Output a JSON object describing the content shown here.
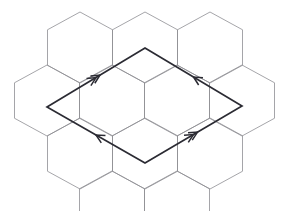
{
  "figure": {
    "canvas": {
      "width": 290,
      "height": 211
    },
    "background_color": "#ffffff"
  },
  "colors": {
    "hex_stroke": "#8e8e93",
    "domain_stroke": "#2b2b33",
    "arrow_stroke": "#2b2b33",
    "background": "#ffffff"
  },
  "style": {
    "hex_stroke_width": 0.8,
    "domain_stroke_width": 1.7,
    "arrow_stroke_width": 1.5
  },
  "hex_lattice": {
    "orientation": "pointy-top",
    "hex_width": 65,
    "hex_height": 71,
    "side_length": 35.5,
    "column_spacing": 65,
    "row_spacing": 53,
    "cell_count": 12,
    "cells": [
      {
        "name": "hex-r0-c0",
        "cx": 80,
        "cy": 12
      },
      {
        "name": "hex-r0-c1",
        "cx": 145,
        "cy": 12
      },
      {
        "name": "hex-r0-c2",
        "cx": 210,
        "cy": 12
      },
      {
        "name": "hex-r1-c0",
        "cx": 47,
        "cy": 65
      },
      {
        "name": "hex-r1-c1",
        "cx": 112,
        "cy": 65
      },
      {
        "name": "hex-r1-c2",
        "cx": 177,
        "cy": 65
      },
      {
        "name": "hex-r1-c3",
        "cx": 242,
        "cy": 65
      },
      {
        "name": "hex-r2-c0",
        "cx": 80,
        "cy": 118
      },
      {
        "name": "hex-r2-c1",
        "cx": 145,
        "cy": 118
      },
      {
        "name": "hex-r2-c2",
        "cx": 210,
        "cy": 118
      },
      {
        "name": "hex-r3-c0",
        "cx": 112,
        "cy": 171
      },
      {
        "name": "hex-r3-c1",
        "cx": 177,
        "cy": 171
      }
    ]
  },
  "fundamental_domain": {
    "shape": "rhombus",
    "vertices": {
      "top": {
        "label": "top",
        "x": 145,
        "y": 48
      },
      "right": {
        "label": "right",
        "x": 242,
        "y": 106
      },
      "bottom": {
        "label": "bottom",
        "x": 145,
        "y": 163
      },
      "left": {
        "label": "left",
        "x": 47,
        "y": 107
      }
    },
    "path": "M 145 48 L 242 106 L 145 163 L 47 107 Z",
    "edges": [
      {
        "name": "edge-top-left",
        "from": "left",
        "to": "top",
        "arrow_count": 2,
        "arrow_direction": "up-right",
        "mark_at": {
          "x": 96,
          "y": 77.6
        },
        "identified_with": "edge-bottom-right"
      },
      {
        "name": "edge-top-right",
        "from": "right",
        "to": "top",
        "arrow_count": 1,
        "arrow_direction": "up-left",
        "mark_at": {
          "x": 193.5,
          "y": 77
        },
        "identified_with": "edge-bottom-left"
      },
      {
        "name": "edge-bottom-right",
        "from": "bottom",
        "to": "right",
        "arrow_count": 2,
        "arrow_direction": "up-right",
        "mark_at": {
          "x": 193.5,
          "y": 134.5
        },
        "identified_with": "edge-top-left"
      },
      {
        "name": "edge-bottom-left",
        "from": "bottom",
        "to": "left",
        "arrow_count": 1,
        "arrow_direction": "up-left",
        "mark_at": {
          "x": 96,
          "y": 135
        },
        "identified_with": "edge-top-right"
      }
    ]
  }
}
